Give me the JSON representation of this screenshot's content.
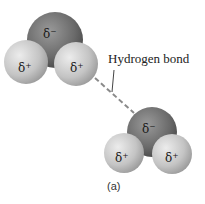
{
  "diagram": {
    "molecule_top": {
      "oxygen_charge": "δ⁻",
      "hydrogen_left_charge": "δ⁺",
      "hydrogen_right_charge": "δ⁺"
    },
    "molecule_bottom": {
      "oxygen_charge": "δ⁻",
      "hydrogen_left_charge": "δ⁺",
      "hydrogen_right_charge": "δ⁺"
    },
    "bond_label": "Hydrogen bond",
    "caption": "(a)",
    "colors": {
      "oxygen": "#6f6f6f",
      "hydrogen": "#cfcfcf",
      "bond_line": "#888888"
    }
  }
}
